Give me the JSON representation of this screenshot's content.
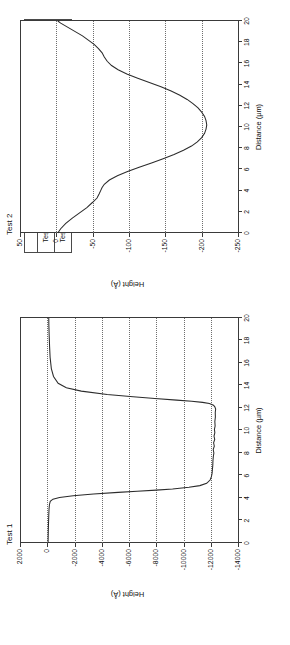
{
  "figure": {
    "orientation": "rotated-90-ccw",
    "background": "#ffffff",
    "trace_color": "#2b2b2b",
    "axis_color": "#3a3a3a",
    "grid_color": "#6e6e6e"
  },
  "table": {
    "name": "cmp-process-conditions",
    "header": {
      "corner": "",
      "platen1": "Platen1",
      "platen2": "Platen2",
      "dishing": "Dishing @ 10 µm via"
    },
    "rows": [
      {
        "label": "Test 1",
        "platen1_slurry": "Slurry 1",
        "platen1_pressure": "3 psi",
        "platen2_slurry": "Slurry 1",
        "platen2_pressure": "1 psi",
        "dishing": "~ 12000 Å"
      },
      {
        "label": "Test 2",
        "platen1_slurry": "Slurry 1",
        "platen1_pressure": "3 psi",
        "platen2_slurry": "Slurry 2",
        "platen2_pressure": "3 psi",
        "dishing": "< 250 Å"
      }
    ]
  },
  "chart_data": [
    {
      "id": "test1",
      "type": "line",
      "title": "Test 1",
      "xlabel": "Distance (µm)",
      "ylabel": "Height (Å)",
      "xlim": [
        0,
        20
      ],
      "ylim": [
        -14000,
        2000
      ],
      "xticks": [
        0,
        2,
        4,
        6,
        8,
        10,
        12,
        14,
        16,
        18,
        20
      ],
      "xticklabels": [
        "0",
        "2",
        "4",
        "6",
        "8",
        "10",
        "12",
        "14",
        "16",
        "18",
        "20"
      ],
      "yticks": [
        2000,
        0,
        -2000,
        -4000,
        -6000,
        -8000,
        -10000,
        -12000,
        -14000
      ],
      "yticklabels": [
        "2000",
        "0",
        "-2000",
        "-4000",
        "-6000",
        "-8000",
        "-10000",
        "-12000",
        "-14000"
      ],
      "grid": "y-gridlines-dotted",
      "legend": "none",
      "x": [
        0.0,
        0.6,
        1.2,
        1.8,
        2.4,
        3.0,
        3.4,
        3.7,
        3.9,
        4.05,
        4.2,
        4.35,
        4.5,
        4.6,
        4.7,
        4.8,
        4.95,
        5.1,
        5.3,
        5.6,
        5.9,
        6.2,
        6.5,
        6.9,
        7.3,
        7.7,
        8.0,
        8.3,
        8.6,
        8.9,
        9.2,
        9.5,
        9.8,
        10.1,
        10.4,
        10.8,
        11.2,
        11.6,
        11.9,
        12.1,
        12.25,
        12.4,
        12.5,
        12.6,
        12.7,
        12.85,
        13.0,
        13.2,
        13.5,
        13.8,
        14.2,
        14.8,
        15.5,
        16.5,
        17.5,
        18.5,
        19.3,
        20.0
      ],
      "y": [
        -60,
        -70,
        -80,
        -95,
        -110,
        -130,
        -160,
        -220,
        -420,
        -900,
        -1900,
        -3400,
        -5200,
        -6600,
        -8000,
        -9200,
        -10400,
        -11200,
        -11700,
        -11950,
        -12050,
        -12100,
        -12120,
        -12150,
        -12160,
        -12190,
        -12230,
        -12180,
        -12260,
        -12210,
        -12290,
        -12240,
        -12300,
        -12270,
        -12320,
        -12300,
        -12340,
        -12330,
        -12360,
        -12300,
        -12200,
        -11900,
        -11400,
        -10600,
        -9500,
        -7900,
        -6300,
        -4400,
        -2500,
        -1400,
        -800,
        -460,
        -300,
        -210,
        -170,
        -140,
        -120,
        -110
      ]
    },
    {
      "id": "test2",
      "type": "line",
      "title": "Test 2",
      "xlabel": "Distance (µm)",
      "ylabel": "Height (Å)",
      "xlim": [
        0,
        20
      ],
      "ylim": [
        -250,
        50
      ],
      "xticks": [
        0,
        2,
        4,
        6,
        8,
        10,
        12,
        14,
        16,
        18,
        20
      ],
      "xticklabels": [
        "0",
        "2",
        "4",
        "6",
        "8",
        "10",
        "12",
        "14",
        "16",
        "18",
        "20"
      ],
      "yticks": [
        50,
        0,
        -50,
        -100,
        -150,
        -200,
        -250
      ],
      "yticklabels": [
        "50",
        "0",
        "-50",
        "-100",
        "-150",
        "-200",
        "-250"
      ],
      "grid": "y-gridlines-dotted",
      "legend": "none",
      "x": [
        0.0,
        0.4,
        0.9,
        1.4,
        1.9,
        2.4,
        2.9,
        3.3,
        3.7,
        4.0,
        4.3,
        4.6,
        5.0,
        5.4,
        5.8,
        6.2,
        6.6,
        7.0,
        7.4,
        7.8,
        8.2,
        8.6,
        9.0,
        9.4,
        9.8,
        10.2,
        10.6,
        11.0,
        11.4,
        11.8,
        12.2,
        12.6,
        13.0,
        13.4,
        13.8,
        14.2,
        14.6,
        15.0,
        15.4,
        15.8,
        16.2,
        16.6,
        17.0,
        17.4,
        17.8,
        18.2,
        18.6,
        19.0,
        19.4,
        19.8,
        20.0
      ],
      "y": [
        -2,
        -6,
        -13,
        -22,
        -32,
        -42,
        -50,
        -56,
        -59,
        -61,
        -63,
        -66,
        -73,
        -84,
        -98,
        -114,
        -131,
        -147,
        -162,
        -175,
        -186,
        -194,
        -200,
        -204,
        -206,
        -207,
        -206,
        -204,
        -200,
        -195,
        -188,
        -180,
        -170,
        -158,
        -144,
        -128,
        -112,
        -97,
        -85,
        -76,
        -70,
        -66,
        -63,
        -58,
        -52,
        -44,
        -36,
        -26,
        -16,
        -6,
        -2
      ]
    }
  ]
}
